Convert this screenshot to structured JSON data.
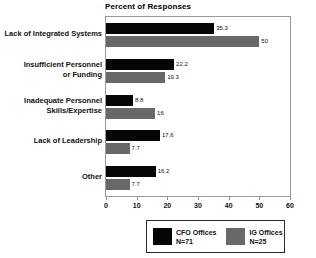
{
  "chart_data": {
    "type": "bar",
    "orientation": "horizontal",
    "title": "Percent of Responses",
    "xlabel": "",
    "ylabel": "",
    "xlim": [
      0,
      60
    ],
    "xticks": [
      0,
      10,
      20,
      30,
      40,
      50,
      60
    ],
    "grid": false,
    "legend_position": "bottom",
    "categories": [
      "Lack of Integrated Systems",
      "Insufficient Personnel or Funding",
      "Inadequate Personnel Skills/Expertise",
      "Lack of Leadership",
      "Other"
    ],
    "category_lines": [
      [
        "Lack of Integrated Systems"
      ],
      [
        "Insufficient Personnel",
        "or Funding"
      ],
      [
        "Inadequate Personnel",
        "Skills/Expertise"
      ],
      [
        "Lack of Leadership"
      ],
      [
        "Other"
      ]
    ],
    "series": [
      {
        "name": "CFO Offices",
        "n_label": "N=71",
        "color": "#060606",
        "values": [
          35.3,
          22.2,
          8.8,
          17.6,
          16.2
        ],
        "value_labels": [
          "35.3",
          "22.2",
          "8.8",
          "17.6",
          "16.2"
        ]
      },
      {
        "name": "IG Offices",
        "n_label": "N=25",
        "color": "#686868",
        "values": [
          50,
          19.3,
          16,
          7.7,
          7.7
        ],
        "value_labels": [
          "50",
          "19.3",
          "16",
          "7.7",
          "7.7"
        ]
      }
    ]
  },
  "legend": {
    "entries": [
      {
        "label": "CFO Offices",
        "n_label": "N=71",
        "swatch": "cfo"
      },
      {
        "label": "IG Offices",
        "n_label": "N=25",
        "swatch": "ig"
      }
    ]
  },
  "axis": {
    "tick_labels": [
      "0",
      "10",
      "20",
      "30",
      "40",
      "50",
      "60"
    ]
  }
}
